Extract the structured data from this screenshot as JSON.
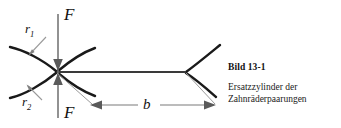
{
  "figure": {
    "caption_title": "Bild 13-1",
    "caption_lines": [
      "Ersatzzylinder der",
      "Zahnräderpaarungen"
    ],
    "labels": {
      "force_top": "F",
      "force_bottom": "F",
      "radius_1": "r",
      "radius_1_sub": "1",
      "radius_2": "r",
      "radius_2_sub": "2",
      "width": "b"
    },
    "colors": {
      "curve": "#1a1a1a",
      "contact_line": "#3a3a3a",
      "force_line": "#6e6e6e",
      "leader_line": "#9a9a9a",
      "dimension_line": "#7a7a7a",
      "text": "#111111",
      "background": "#ffffff"
    },
    "geometry": {
      "contact_point": [
        57,
        72
      ],
      "force_line_x": 58,
      "force_line_top_y": 14,
      "force_line_bottom_y": 118,
      "contact_line_start_x": 57,
      "contact_line_end_x": 185,
      "contact_line_y": 72,
      "dimension_line_y": 105,
      "dimension_start_x": 90,
      "dimension_end_x": 215
    }
  }
}
